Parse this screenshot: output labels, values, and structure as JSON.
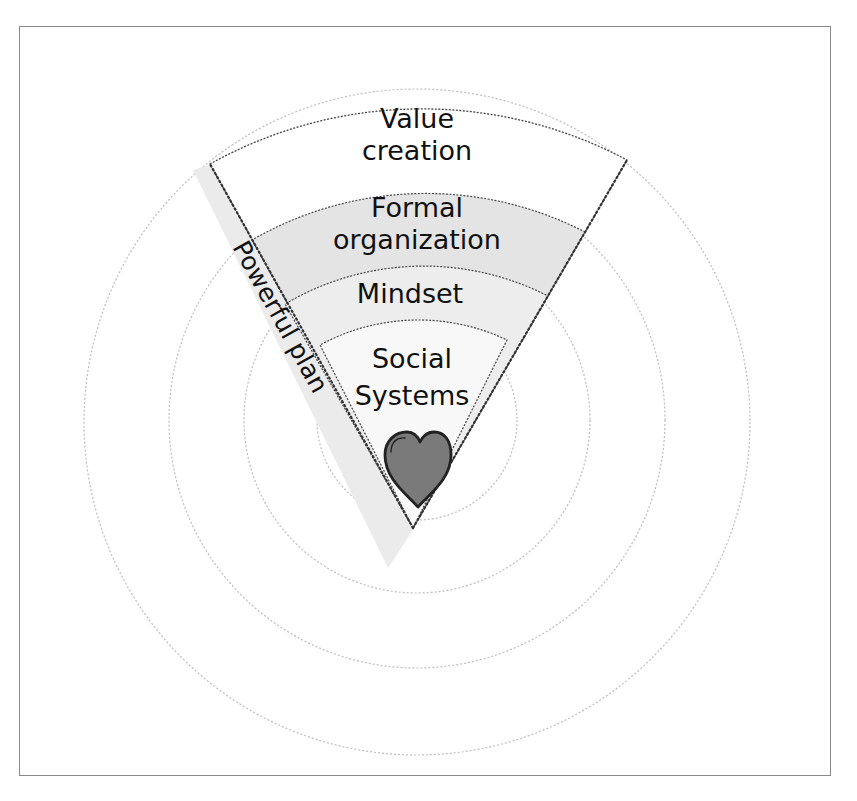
{
  "diagram": {
    "title": "",
    "layers": [
      {
        "id": "value-creation",
        "label_line1": "Value",
        "label_line2": "creation",
        "fill": "#ffffff"
      },
      {
        "id": "formal-organization",
        "label_line1": "Formal",
        "label_line2": "organization",
        "fill": "#e6e6e6"
      },
      {
        "id": "mindset",
        "label_line1": "Mindset",
        "label_line2": "",
        "fill": "#ececec"
      },
      {
        "id": "social-systems",
        "label_line1": "Social",
        "label_line2": "Systems",
        "fill": "#f7f7f7"
      }
    ],
    "side_band": {
      "label": "Powerful plan",
      "fill": "#ebebeb"
    },
    "core_icon": {
      "name": "heart",
      "fill": "#7a7a7a",
      "stroke": "#222222"
    },
    "rings": {
      "count": 4,
      "stroke": "#bdbdbd"
    }
  }
}
